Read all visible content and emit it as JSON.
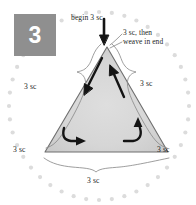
{
  "step": {
    "number": "3"
  },
  "diagram": {
    "shape": "triangle",
    "border": "dotted-circle",
    "labels": {
      "begin": "begin 3 sc",
      "weave_line1": "3 sc, then",
      "weave_line2": "weave in end",
      "left_side": "3 sc",
      "right_side": "3 sc",
      "bottom_left_corner": "3 sc",
      "bottom_right_corner": "3 sc",
      "bottom_side": "3 sc"
    },
    "colors": {
      "badge": "#8f8f8f",
      "badge_text": "#ffffff",
      "triangle_fill": "#d9d9d9",
      "triangle_stroke": "#7a7a7a",
      "dots": "#dcdcdc",
      "arrow": "#1a1a1a",
      "brace": "#8a8a8a",
      "text": "#231f1d"
    },
    "counts": {
      "border_dots": 44
    }
  }
}
